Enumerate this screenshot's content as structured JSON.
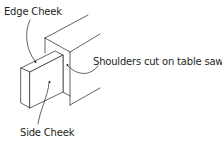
{
  "diagram": {
    "colors": {
      "line": "#231f20",
      "text": "#231f20",
      "background": "#ffffff"
    },
    "labels": {
      "edge_cheek": "Edge Cheek",
      "shoulders": "Shoulders cut on table saw.",
      "side_cheek": "Side Cheek"
    }
  }
}
